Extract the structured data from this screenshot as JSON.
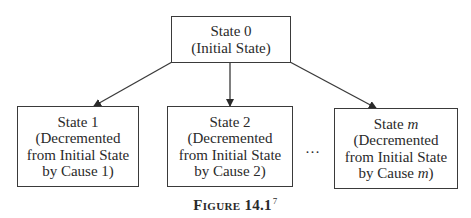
{
  "diagram": {
    "root": {
      "title": "State 0",
      "subtitle": "(Initial State)"
    },
    "children": [
      {
        "title": "State 1",
        "line1": "(Decremented",
        "line2": "from Initial State",
        "line3": "by Cause 1)"
      },
      {
        "title": "State 2",
        "line1": "(Decremented",
        "line2": "from Initial State",
        "line3": "by Cause 2)"
      },
      {
        "title_prefix": "State ",
        "title_var": "m",
        "line1": "(Decremented",
        "line2": "from Initial State",
        "line3_prefix": "by Cause ",
        "line3_var": "m",
        "line3_suffix": ")"
      }
    ],
    "ellipsis": "…",
    "edges": [
      {
        "from": "State 0",
        "to": "State 1"
      },
      {
        "from": "State 0",
        "to": "State 2"
      },
      {
        "from": "State 0",
        "to": "State m"
      }
    ]
  },
  "caption": {
    "label": "Figure 14.1",
    "footnote": "7"
  },
  "colors": {
    "stroke": "#3a3a3a",
    "text": "#2a2a2a",
    "background": "#ffffff"
  }
}
